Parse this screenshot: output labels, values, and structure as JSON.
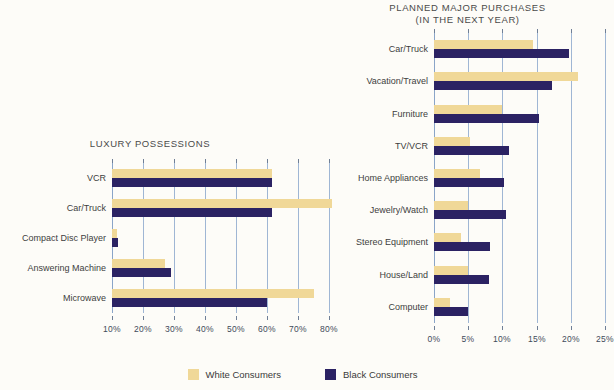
{
  "legend": {
    "items": [
      {
        "label": "White Consumers",
        "color": "#f0d898",
        "key": "white"
      },
      {
        "label": "Black Consumers",
        "color": "#2b2263",
        "key": "black"
      }
    ]
  },
  "chart_data": [
    {
      "id": "luxury-possessions",
      "type": "bar",
      "orientation": "horizontal",
      "title": "LUXURY POSSESSIONS",
      "title_line2": "",
      "xlabel": "",
      "ylabel": "",
      "xlim": [
        10,
        80
      ],
      "xticks": [
        10,
        20,
        30,
        40,
        50,
        60,
        70,
        80
      ],
      "xtick_labels": [
        "10%",
        "20%",
        "30%",
        "40%",
        "50%",
        "60%",
        "70%",
        "80%"
      ],
      "grid": true,
      "legend_position": "bottom-center",
      "categories": [
        "VCR",
        "Car/Truck",
        "Compact Disc Player",
        "Answering Machine",
        "Microwave"
      ],
      "series": [
        {
          "name": "White Consumers",
          "color": "#f0d898",
          "values": [
            61.5,
            81,
            11.5,
            27,
            75
          ]
        },
        {
          "name": "Black Consumers",
          "color": "#2b2263",
          "values": [
            61.5,
            61.5,
            12,
            29,
            60
          ]
        }
      ]
    },
    {
      "id": "planned-major-purchases",
      "type": "bar",
      "orientation": "horizontal",
      "title": "PLANNED MAJOR PURCHASES",
      "title_line2": "(IN THE NEXT YEAR)",
      "xlabel": "",
      "ylabel": "",
      "xlim": [
        0,
        25
      ],
      "xticks": [
        0,
        5,
        10,
        15,
        20,
        25
      ],
      "xtick_labels": [
        "0%",
        "5%",
        "10%",
        "15%",
        "20%",
        "25%"
      ],
      "grid": true,
      "legend_position": "bottom-center",
      "categories": [
        "Car/Truck",
        "Vacation/Travel",
        "Furniture",
        "TV/VCR",
        "Home Appliances",
        "Jewelry/Watch",
        "Stereo Equipment",
        "House/Land",
        "Computer"
      ],
      "series": [
        {
          "name": "White Consumers",
          "color": "#f0d898",
          "values": [
            14.5,
            21,
            10,
            5.2,
            6.7,
            5,
            4,
            5,
            2.4
          ]
        },
        {
          "name": "Black Consumers",
          "color": "#2b2263",
          "values": [
            19.8,
            17.3,
            15.3,
            11,
            10.2,
            10.5,
            8.2,
            8,
            5
          ]
        }
      ]
    }
  ]
}
